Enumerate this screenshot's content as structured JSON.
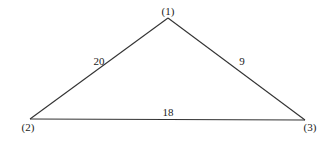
{
  "diagram": {
    "type": "weighted-graph",
    "nodes": [
      {
        "id": "1",
        "label": "(1)"
      },
      {
        "id": "2",
        "label": "(2)"
      },
      {
        "id": "3",
        "label": "(3)"
      }
    ],
    "edges": [
      {
        "from": "1",
        "to": "2",
        "weight": "20"
      },
      {
        "from": "1",
        "to": "3",
        "weight": "9"
      },
      {
        "from": "2",
        "to": "3",
        "weight": "18"
      }
    ],
    "colors": {
      "line": "#333333",
      "text": "#222222",
      "background": "#ffffff"
    }
  }
}
